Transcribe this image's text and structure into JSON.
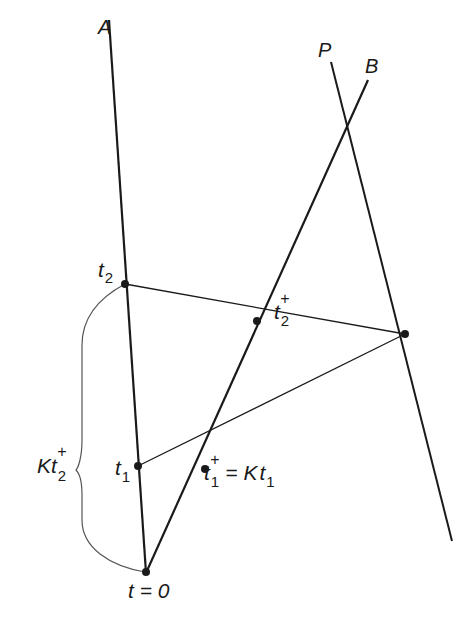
{
  "figure": {
    "line_labels": {
      "A": "A",
      "P": "P",
      "B": "B"
    },
    "point_labels": {
      "t2": {
        "base": "t",
        "sub": "2"
      },
      "t2_plus": {
        "base": "t",
        "sub": "2",
        "sup": "+"
      },
      "t1": {
        "base": "t",
        "sub": "1"
      },
      "t1_plus": {
        "base": "t",
        "sub": "1",
        "sup": "+",
        "rest": " = K",
        "rest_t": "t",
        "rest_sub": "1"
      },
      "t0": "t = 0",
      "brace": {
        "base": "Kt",
        "sub": "2",
        "sup": "+"
      }
    },
    "colors": {
      "ink": "#1a1a1a",
      "brace": "#555555",
      "background": "#ffffff"
    }
  }
}
